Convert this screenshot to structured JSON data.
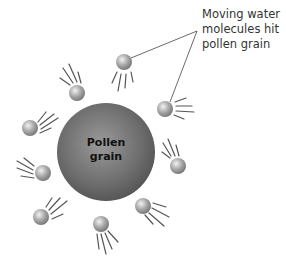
{
  "diagram": {
    "callout": {
      "lines": [
        "Moving water",
        "molecules hit",
        "pollen grain"
      ]
    },
    "pollen_grain": {
      "label_lines": [
        "Pollen",
        "grain"
      ],
      "cx": 106,
      "cy": 152,
      "r": 49,
      "color": "#6e6e6e"
    },
    "molecule_color": "#a8a8a8",
    "molecules": [
      {
        "cx": 124,
        "cy": 62,
        "r": 8,
        "trail": "down"
      },
      {
        "cx": 165,
        "cy": 109,
        "r": 8,
        "trail": "right"
      },
      {
        "cx": 77,
        "cy": 93,
        "r": 8,
        "trail": "up-left"
      },
      {
        "cx": 30,
        "cy": 128,
        "r": 8,
        "trail": "up-right"
      },
      {
        "cx": 43,
        "cy": 173,
        "r": 8,
        "trail": "up-left"
      },
      {
        "cx": 41,
        "cy": 217,
        "r": 8,
        "trail": "up-right"
      },
      {
        "cx": 101,
        "cy": 224,
        "r": 8,
        "trail": "down"
      },
      {
        "cx": 143,
        "cy": 206,
        "r": 8,
        "trail": "down-right"
      },
      {
        "cx": 178,
        "cy": 166,
        "r": 8,
        "trail": "up-left"
      }
    ]
  }
}
